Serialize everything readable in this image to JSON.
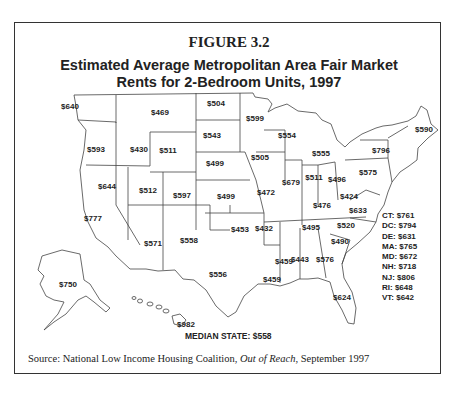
{
  "figure": {
    "label": "FIGURE 3.2",
    "title_line1": "Estimated Average Metropolitan Area Fair Market",
    "title_line2": "Rents for 2-Bedroom Units, 1997",
    "median": "MEDIAN STATE:  $558",
    "source_prefix": "Source: National Low Income Housing Coalition, ",
    "source_italic": "Out of Reach",
    "source_suffix": ", September 1997"
  },
  "map_labels": [
    {
      "state": "WA",
      "value": "$640",
      "x": 70,
      "y": 106
    },
    {
      "state": "OR",
      "value": "$593",
      "x": 96,
      "y": 149
    },
    {
      "state": "ID",
      "value": "$430",
      "x": 139,
      "y": 149
    },
    {
      "state": "MT",
      "value": "$469",
      "x": 160,
      "y": 112
    },
    {
      "state": "WY",
      "value": "$511",
      "x": 168,
      "y": 150
    },
    {
      "state": "ND",
      "value": "$504",
      "x": 216,
      "y": 103
    },
    {
      "state": "SD",
      "value": "$543",
      "x": 212,
      "y": 135
    },
    {
      "state": "NE",
      "value": "$499",
      "x": 215,
      "y": 163
    },
    {
      "state": "MN",
      "value": "$599",
      "x": 255,
      "y": 118
    },
    {
      "state": "WI",
      "value": "$554",
      "x": 287,
      "y": 135
    },
    {
      "state": "MI",
      "value": "$555",
      "x": 321,
      "y": 153
    },
    {
      "state": "IA",
      "value": "$505",
      "x": 260,
      "y": 157
    },
    {
      "state": "IL",
      "value": "$679",
      "x": 291,
      "y": 182
    },
    {
      "state": "IN",
      "value": "$511",
      "x": 314,
      "y": 177
    },
    {
      "state": "OH",
      "value": "$496",
      "x": 337,
      "y": 179
    },
    {
      "state": "PA",
      "value": "$575",
      "x": 368,
      "y": 172
    },
    {
      "state": "NY",
      "value": "$796",
      "x": 381,
      "y": 150
    },
    {
      "state": "ME",
      "value": "$590",
      "x": 424,
      "y": 129
    },
    {
      "state": "NV",
      "value": "$644",
      "x": 107,
      "y": 186
    },
    {
      "state": "UT",
      "value": "$512",
      "x": 148,
      "y": 190
    },
    {
      "state": "CO",
      "value": "$597",
      "x": 182,
      "y": 195
    },
    {
      "state": "KS",
      "value": "$499",
      "x": 226,
      "y": 196
    },
    {
      "state": "MO",
      "value": "$472",
      "x": 266,
      "y": 192
    },
    {
      "state": "KY",
      "value": "$476",
      "x": 322,
      "y": 205
    },
    {
      "state": "WV",
      "value": "$424",
      "x": 349,
      "y": 196
    },
    {
      "state": "VA",
      "value": "$633",
      "x": 358,
      "y": 210
    },
    {
      "state": "CA",
      "value": "$777",
      "x": 93,
      "y": 218
    },
    {
      "state": "AZ",
      "value": "$571",
      "x": 153,
      "y": 243
    },
    {
      "state": "NM",
      "value": "$558",
      "x": 189,
      "y": 240
    },
    {
      "state": "OK",
      "value": "$453",
      "x": 240,
      "y": 229
    },
    {
      "state": "AR",
      "value": "$432",
      "x": 264,
      "y": 228
    },
    {
      "state": "TN",
      "value": "$495",
      "x": 311,
      "y": 227
    },
    {
      "state": "NC",
      "value": "$520",
      "x": 346,
      "y": 225
    },
    {
      "state": "SC",
      "value": "$490",
      "x": 340,
      "y": 241
    },
    {
      "state": "MS",
      "value": "$459",
      "x": 284,
      "y": 261
    },
    {
      "state": "AL",
      "value": "$443",
      "x": 300,
      "y": 259
    },
    {
      "state": "GA",
      "value": "$576",
      "x": 325,
      "y": 259
    },
    {
      "state": "LA",
      "value": "$459",
      "x": 272,
      "y": 279
    },
    {
      "state": "TX",
      "value": "$556",
      "x": 218,
      "y": 274
    },
    {
      "state": "FL",
      "value": "$624",
      "x": 342,
      "y": 297
    },
    {
      "state": "AK",
      "value": "$750",
      "x": 68,
      "y": 284
    },
    {
      "state": "HI",
      "value": "$982",
      "x": 186,
      "y": 324
    }
  ],
  "legend": [
    "CT: $761",
    "DC: $794",
    "DE: $631",
    "MA: $765",
    "MD: $672",
    "NH: $718",
    "NJ: $806",
    "RI: $648",
    "VT: $642"
  ],
  "chart_data": {
    "type": "table",
    "categories": [
      "WA",
      "OR",
      "CA",
      "ID",
      "NV",
      "MT",
      "WY",
      "UT",
      "AZ",
      "CO",
      "NM",
      "ND",
      "SD",
      "NE",
      "KS",
      "OK",
      "TX",
      "MN",
      "IA",
      "MO",
      "AR",
      "LA",
      "WI",
      "IL",
      "MI",
      "IN",
      "OH",
      "KY",
      "TN",
      "MS",
      "AL",
      "GA",
      "FL",
      "SC",
      "NC",
      "VA",
      "WV",
      "PA",
      "NY",
      "ME",
      "AK",
      "HI",
      "CT",
      "DC",
      "DE",
      "MA",
      "MD",
      "NH",
      "NJ",
      "RI",
      "VT"
    ],
    "values": [
      640,
      593,
      777,
      430,
      644,
      469,
      511,
      512,
      571,
      597,
      558,
      504,
      543,
      499,
      499,
      453,
      556,
      599,
      505,
      472,
      432,
      459,
      554,
      679,
      555,
      511,
      496,
      476,
      495,
      459,
      443,
      576,
      624,
      490,
      520,
      633,
      424,
      575,
      796,
      590,
      750,
      982,
      761,
      794,
      631,
      765,
      672,
      718,
      806,
      648,
      642
    ],
    "median": 558,
    "unit": "USD per month"
  }
}
